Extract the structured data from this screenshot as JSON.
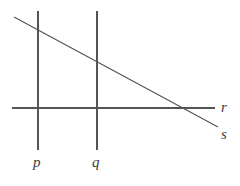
{
  "figure": {
    "type": "geometry-diagram",
    "width": 240,
    "height": 186,
    "background_color": "#ffffff",
    "stroke_color": "#555555",
    "stroke_width": 1.2,
    "label_color": "#3a3a3a",
    "labels": {
      "p": "p",
      "q": "q",
      "r": "r",
      "s": "s"
    },
    "lines": [
      {
        "name": "p",
        "orientation": "vertical",
        "x1": 38,
        "y1": 11,
        "x2": 38,
        "y2": 150
      },
      {
        "name": "q",
        "orientation": "vertical",
        "x1": 97,
        "y1": 11,
        "x2": 97,
        "y2": 150
      },
      {
        "name": "r",
        "orientation": "horizontal",
        "x1": 12,
        "y1": 108,
        "x2": 215,
        "y2": 108
      },
      {
        "name": "s",
        "orientation": "diagonal",
        "x1": 14,
        "y1": 17,
        "x2": 218,
        "y2": 127
      }
    ],
    "label_positions": {
      "p": {
        "x": 38,
        "y": 163
      },
      "q": {
        "x": 97,
        "y": 163
      },
      "r": {
        "x": 224,
        "y": 107
      },
      "s": {
        "x": 224,
        "y": 134
      }
    }
  }
}
